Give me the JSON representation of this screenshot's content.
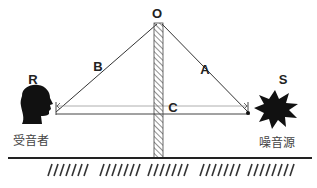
{
  "diagram": {
    "type": "sound-barrier-path-difference",
    "points": {
      "top": "O",
      "receiver": "R",
      "source": "S"
    },
    "segments": {
      "left_diffracted": "B",
      "right_diffracted": "A",
      "direct": "C"
    },
    "captions": {
      "receiver": "受音者",
      "source": "噪音源"
    },
    "colors": {
      "line": "#333333",
      "thin_line": "#888888",
      "fill": "#111111",
      "hatch": "#555555"
    }
  }
}
